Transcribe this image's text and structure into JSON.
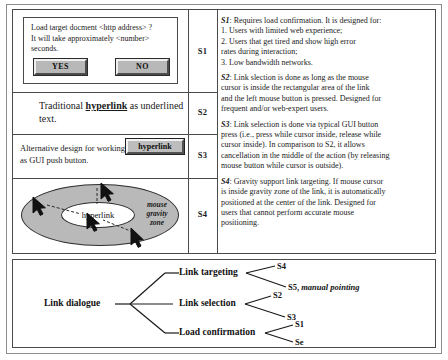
{
  "scenarios": {
    "s1": {
      "label": "S1",
      "dialog": {
        "message_line1": "Load target docment <http address> ?",
        "message_line2": "It will take approximately <number>",
        "message_line3": "seconds.",
        "yes_label": "YES",
        "no_label": "NO"
      }
    },
    "s2": {
      "label": "S2",
      "text_before": "Traditional ",
      "link_word": "hyperlink",
      "text_after": " as underlined text."
    },
    "s3": {
      "label": "S3",
      "text": "Alternative design for working as GUI push button.",
      "button_label": "hyperlink"
    },
    "s4": {
      "label": "S4",
      "link_label": "hyperlink",
      "zone_caption_line1": "mouse",
      "zone_caption_line2": "gravity",
      "zone_caption_line3": "zone"
    }
  },
  "descriptions": [
    {
      "id": "S1",
      "intro": ": Requires load confirmation. It is designed for:",
      "items": [
        "1. Users with limited web experience;",
        "2. Users that get tired and show high error",
        "rates during interaction;",
        "3. Low bandwidth networks."
      ]
    },
    {
      "id": "S2",
      "intro": ": Link slection is done as long as the mouse",
      "items": [
        "cursor is inside the rectangular area of the link",
        "and the left mouse button is pressed. Designed for",
        "frequent and/or web-expert users."
      ]
    },
    {
      "id": "S3",
      "intro": ": Link selection is done via typical GUI button",
      "items": [
        "press (i.e., press while cursor inside, release while",
        "cursor inside). In comparison to S2, it allows",
        "cancellation in the middle of the action (by releasing",
        "mouse button while cursor is outside)."
      ]
    },
    {
      "id": "S4",
      "intro": ": Gravity support link targeting. If mouse cursor",
      "items": [
        "is inside gravity zone of the link, it is automatically",
        "positioned at the center of the link. Designed for",
        "users that cannot perform accurate mouse",
        "positioning."
      ]
    }
  ],
  "tree": {
    "root": "Link dialogue",
    "branches": [
      {
        "name": "Link targeting",
        "leaves": [
          {
            "code": "S4",
            "note": ""
          },
          {
            "code": "S5,",
            "note": "manual pointing"
          }
        ]
      },
      {
        "name": "Link selection",
        "leaves": [
          {
            "code": "S2",
            "note": ""
          },
          {
            "code": "S3",
            "note": ""
          }
        ]
      },
      {
        "name": "Load confirmation",
        "leaves": [
          {
            "code": "S1",
            "note": ""
          },
          {
            "code": "Se",
            "note": ""
          }
        ]
      }
    ]
  },
  "colors": {
    "frame": "#8c8c8c",
    "rule": "#4a4a4a",
    "gravity_zone": "#b9b9b9",
    "button_face": "#b8b8b8",
    "text": "#1a1a1a"
  }
}
